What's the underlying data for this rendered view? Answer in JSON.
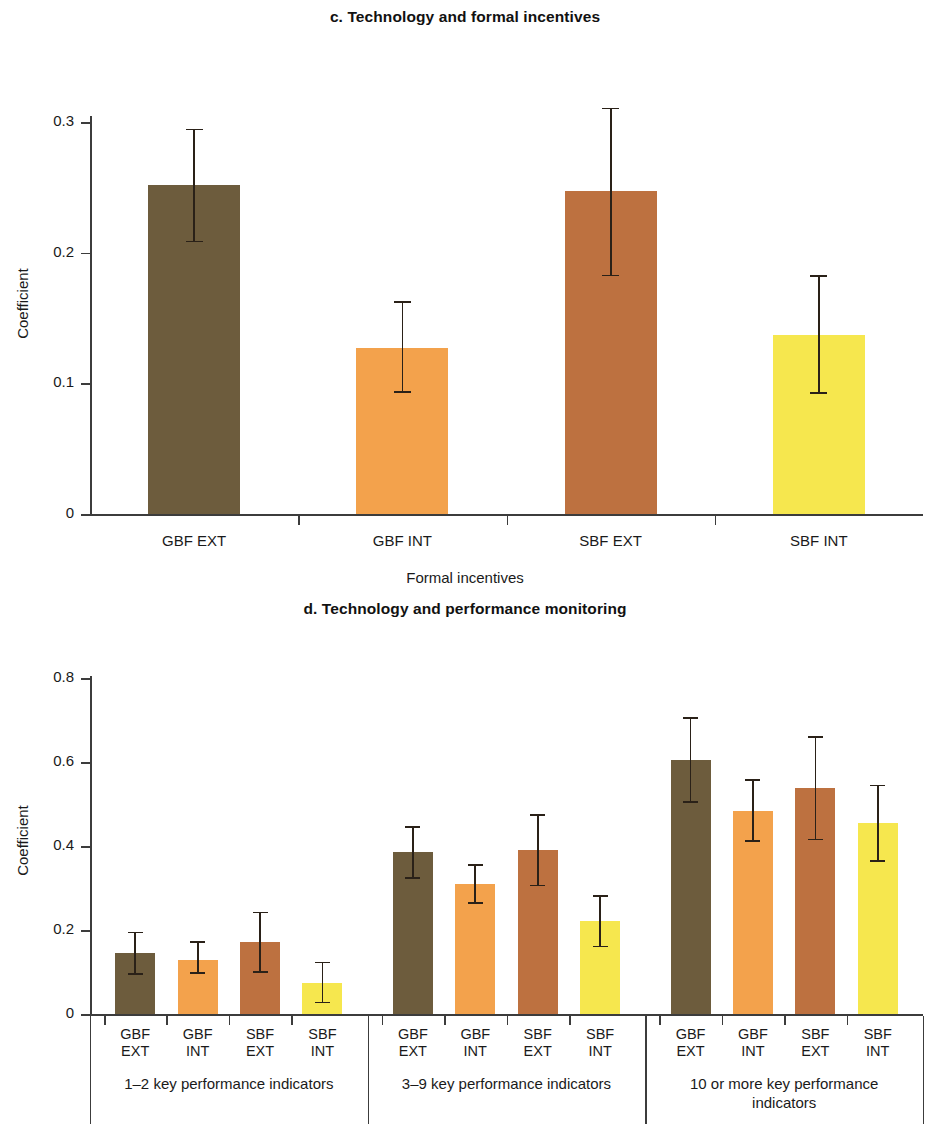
{
  "colors": {
    "gbf_ext": "#6d5c3d",
    "gbf_int": "#f3a24c",
    "sbf_ext": "#bd7140",
    "sbf_int": "#f6e74e",
    "axis": "#3c3c3c",
    "error": "#2a2118",
    "background": "#ffffff"
  },
  "series_names": [
    "GBF EXT",
    "GBF INT",
    "SBF EXT",
    "SBF INT"
  ],
  "panel_c": {
    "title": "c. Technology and formal incentives",
    "ylabel": "Coefficient",
    "xlabel": "Formal incentives",
    "yticks": [
      "0",
      "0.1",
      "0.2",
      "0.3"
    ],
    "categories": [
      "GBF EXT",
      "GBF INT",
      "SBF EXT",
      "SBF INT"
    ]
  },
  "panel_d": {
    "title": "d. Technology and performance monitoring",
    "ylabel": "Coefficient",
    "yticks": [
      "0",
      "0.2",
      "0.4",
      "0.6",
      "0.8"
    ],
    "groups": [
      {
        "label": "1–2 key performance indicators",
        "categories": [
          "GBF\nEXT",
          "GBF\nINT",
          "SBF\nEXT",
          "SBF\nINT"
        ]
      },
      {
        "label": "3–9 key performance indicators",
        "categories": [
          "GBF\nEXT",
          "GBF\nINT",
          "SBF\nEXT",
          "SBF\nINT"
        ]
      },
      {
        "label": "10 or more key performance\nindicators",
        "categories": [
          "GBF\nEXT",
          "GBF\nINT",
          "SBF\nEXT",
          "SBF\nINT"
        ]
      }
    ]
  },
  "chart_data": [
    {
      "type": "bar",
      "panel": "c",
      "title": "c. Technology and formal incentives",
      "xlabel": "Formal incentives",
      "ylabel": "Coefficient",
      "ylim": [
        0,
        0.32
      ],
      "yticks": [
        0,
        0.1,
        0.2,
        0.3
      ],
      "grid": false,
      "legend": "none",
      "categories": [
        "GBF EXT",
        "GBF INT",
        "SBF EXT",
        "SBF INT"
      ],
      "values": [
        0.252,
        0.127,
        0.247,
        0.137
      ],
      "error_low": [
        0.208,
        0.093,
        0.182,
        0.092
      ],
      "error_high": [
        0.295,
        0.163,
        0.311,
        0.183
      ],
      "bar_colors": [
        "#6d5c3d",
        "#f3a24c",
        "#bd7140",
        "#f6e74e"
      ]
    },
    {
      "type": "bar",
      "panel": "d",
      "title": "d. Technology and performance monitoring",
      "xlabel": "",
      "ylabel": "Coefficient",
      "ylim": [
        0,
        0.82
      ],
      "yticks": [
        0,
        0.2,
        0.4,
        0.6,
        0.8
      ],
      "grid": false,
      "legend": "none",
      "groups": [
        "1–2 key performance indicators",
        "3–9 key performance indicators",
        "10 or more key performance indicators"
      ],
      "categories": [
        "GBF EXT",
        "GBF INT",
        "SBF EXT",
        "SBF INT"
      ],
      "series": [
        {
          "name": "GBF EXT",
          "color": "#6d5c3d",
          "values": [
            0.145,
            0.385,
            0.605
          ],
          "error_low": [
            0.093,
            0.322,
            0.503
          ],
          "error_high": [
            0.196,
            0.448,
            0.707
          ]
        },
        {
          "name": "GBF INT",
          "color": "#f3a24c",
          "values": [
            0.129,
            0.311,
            0.485
          ],
          "error_low": [
            0.095,
            0.263,
            0.411
          ],
          "error_high": [
            0.174,
            0.358,
            0.559
          ]
        },
        {
          "name": "SBF EXT",
          "color": "#bd7140",
          "values": [
            0.171,
            0.391,
            0.538
          ],
          "error_low": [
            0.098,
            0.304,
            0.414
          ],
          "error_high": [
            0.244,
            0.476,
            0.662
          ]
        },
        {
          "name": "SBF INT",
          "color": "#f6e74e",
          "values": [
            0.074,
            0.221,
            0.455
          ],
          "error_low": [
            0.025,
            0.159,
            0.362
          ],
          "error_high": [
            0.125,
            0.283,
            0.547
          ]
        }
      ]
    }
  ]
}
